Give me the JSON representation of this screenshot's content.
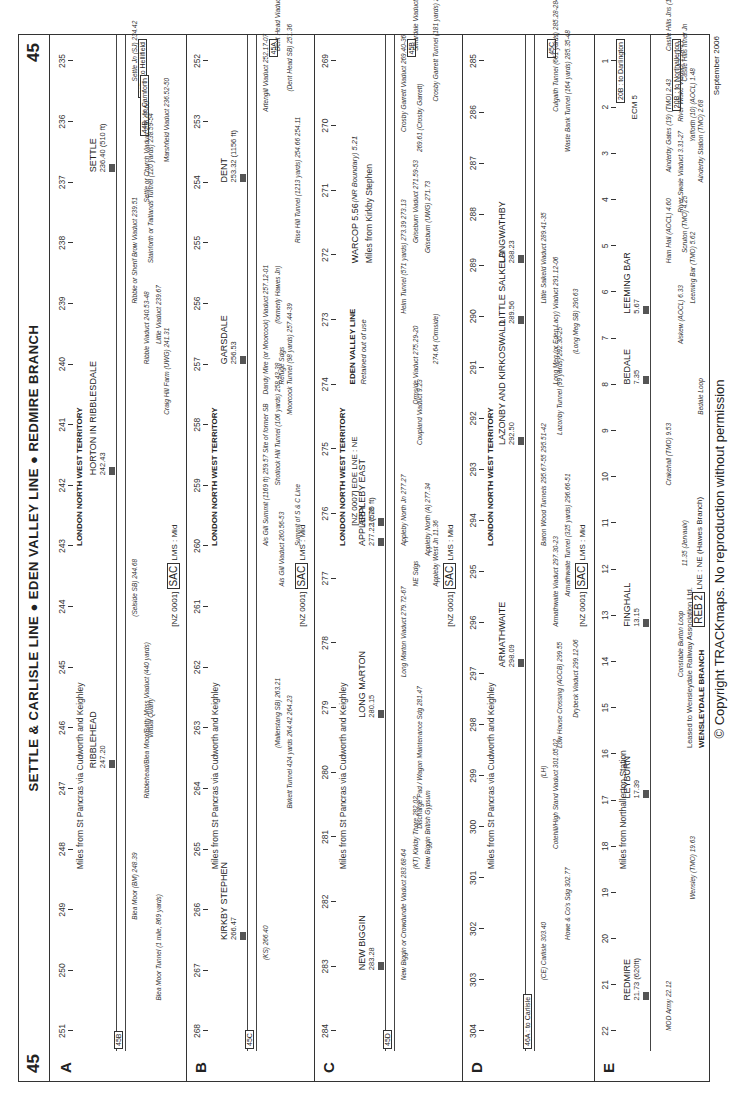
{
  "page": {
    "number": "45",
    "title": "SETTLE & CARLISLE LINE ● EDEN VALLEY LINE ● REDMIRE BRANCH",
    "copyright": "© Copyright TRACKmaps. No reproduction without permission",
    "date": "September 2006"
  },
  "strips": [
    {
      "letter": "A",
      "territory": "LONDON NORTH WEST TERRITORY",
      "miles_note": "Miles from St Pancras via Cudworth and Keighley",
      "code": {
        "prefix": "[NZ 0001]",
        "elr": "SAC",
        "suffix": "LMS : Mid"
      },
      "left_connector": "45B",
      "right_connector": "44B : to Hellifield",
      "branch_connector": "44B : to Carnforth",
      "mileposts": [
        "251",
        "250",
        "249",
        "248",
        "247",
        "246",
        "245",
        "244",
        "243",
        "242",
        "241",
        "240",
        "239",
        "238",
        "237",
        "236",
        "235"
      ],
      "stations": [
        {
          "name": "RIBBLEHEAD",
          "mileage": "247.20",
          "x": 0.28
        },
        {
          "name": "HORTON IN RIBBLESDALE",
          "mileage": "242.43",
          "x": 0.57
        },
        {
          "name": "SETTLE",
          "mileage": "236.40 (510 ft)",
          "x": 0.87
        }
      ],
      "features": [
        {
          "text": "Blea Moor (BM) 248.39",
          "x": 0.13
        },
        {
          "text": "Blea Moor Tunnel (1 mile, 869 yards)",
          "x": 0.05
        },
        {
          "text": "Ribblehead/Blea Moor/Batty Moss Viaduct (440 yards)",
          "x": 0.25
        },
        {
          "text": "Virtual Quarry",
          "x": 0.31
        },
        {
          "text": "(Selside SB) 244.68",
          "x": 0.43
        },
        {
          "text": "Craig Hill Farm (UWG) 241.31",
          "x": 0.63
        },
        {
          "text": "Ribble Viaduct 240.53-48",
          "x": 0.68
        },
        {
          "text": "Little Viaduct 239.67",
          "x": 0.7
        },
        {
          "text": "Ribble or Sherif Brow Viaduct 239.51",
          "x": 0.74
        },
        {
          "text": "Stainforth or Taitlands Tunnel (120 yards) 238.59-54",
          "x": 0.78
        },
        {
          "text": "Settle or Church Viaduct 236.67-60",
          "x": 0.84
        },
        {
          "text": "Marshfield Viaduct 236.52-50",
          "x": 0.88
        },
        {
          "text": "Settle Jn (SJ) 234.42",
          "x": 0.96
        }
      ]
    },
    {
      "letter": "B",
      "territory": "LONDON NORTH WEST TERRITORY",
      "miles_note": "Miles from St Pancras via Cudworth and Keighley",
      "code": {
        "prefix": "[NZ 0001]",
        "elr": "SAC",
        "suffix": "LMS : Mid"
      },
      "left_connector": "45C",
      "right_connector": "45A",
      "mileposts": [
        "268",
        "267",
        "266",
        "265",
        "264",
        "263",
        "262",
        "261",
        "260",
        "259",
        "258",
        "257",
        "256",
        "255",
        "254",
        "253",
        "252"
      ],
      "stations": [
        {
          "name": "KIRKBY STEPHEN",
          "mileage": "266.47",
          "x": 0.11
        },
        {
          "name": "GARSDALE",
          "mileage": "256.53",
          "x": 0.68
        },
        {
          "name": "DENT",
          "mileage": "253.32 (1156 ft)",
          "x": 0.86
        }
      ],
      "features": [
        {
          "text": "(KS) 266.40",
          "x": 0.09
        },
        {
          "text": "Birkett Tunnel 424 yards 264.42 264.23",
          "x": 0.24
        },
        {
          "text": "(Mallerstang SB) 263.21",
          "x": 0.3
        },
        {
          "text": "Ais Gill Viaduct 260.56-53",
          "x": 0.46
        },
        {
          "text": "Ais Gill Summit (1169 ft) 259.57 Site of former SB",
          "x": 0.5
        },
        {
          "text": "Summit of S & C Line",
          "x": 0.5
        },
        {
          "text": "Shotlock Hill Tunnel (106 yards) 258.43-38",
          "x": 0.56
        },
        {
          "text": "Moorcock Tunnel (98 yards) 257.44-39",
          "x": 0.63
        },
        {
          "text": "Dandy Mire (or Moorcock) Viaduct 257.12-01",
          "x": 0.65
        },
        {
          "text": "Refuge Sdgs",
          "x": 0.66
        },
        {
          "text": "(formerly Hawes Jn)",
          "x": 0.72
        },
        {
          "text": "Rise Hill Tunnel (1213 yards) 254.66 254.11",
          "x": 0.8
        },
        {
          "text": "Artengill Viaduct 252.17-07",
          "x": 0.93
        },
        {
          "text": "(Dent Head SB) 251.36",
          "x": 0.95
        },
        {
          "text": "Dent Head Viaduct 251.22-12",
          "x": 0.99
        }
      ]
    },
    {
      "letter": "C",
      "territory": "LONDON NORTH WEST TERRITORY",
      "miles_note": "Miles from St Pancras via Cudworth and Keighley",
      "code": {
        "prefix": "[NZ 0001]",
        "elr": "SAC",
        "suffix": "LMS : Mid"
      },
      "code2": {
        "prefix": "[NZ 0007]",
        "elr": "EDE",
        "suffix": "LNE : NE"
      },
      "eden_valley": {
        "title": "EDEN VALLEY LINE",
        "note": "Retained out of use",
        "miles_note": "Miles from Kirkby Stephen",
        "warcop": "WARCOP 5.56",
        "boundary": "(NR Boundary) 5.21",
        "railway": "(Stockton & Darlington Eden Valley Railway)"
      },
      "left_connector": "45D",
      "right_connector": "45B",
      "mileposts": [
        "284",
        "283",
        "282",
        "281",
        "280",
        "279",
        "278",
        "277",
        "276",
        "275",
        "274",
        "273",
        "272",
        "271",
        "270",
        "269"
      ],
      "stations": [
        {
          "name": "NEW BIGGIN",
          "mileage": "283.28",
          "x": 0.08
        },
        {
          "name": "LONG MARTON",
          "mileage": "280.15",
          "x": 0.33
        },
        {
          "name": "APPLEBY",
          "mileage": "277.22 (525 ft)",
          "x": 0.5
        },
        {
          "name": "APPLEBY EAST",
          "mileage": "10.78",
          "x": 0.52
        }
      ],
      "features": [
        {
          "text": "New Biggin or Crowdundle Viaduct 283.68-64",
          "x": 0.07
        },
        {
          "text": "New Biggin British Gypsum",
          "x": 0.18
        },
        {
          "text": "(KT) Kirkby Thore 282.02",
          "x": 0.18
        },
        {
          "text": "Discharge Pad / Wagon Maintenance Sdg 281.47",
          "x": 0.22
        },
        {
          "text": "Long Marton Viaduct 279.72-67",
          "x": 0.37
        },
        {
          "text": "Appleby West Jn 11.36",
          "x": 0.46
        },
        {
          "text": "NE Sdgs",
          "x": 0.46
        },
        {
          "text": "Appleby North (A) 277.34",
          "x": 0.49
        },
        {
          "text": "Appleby North Jn 277.27",
          "x": 0.5
        },
        {
          "text": "Coupland Viaduct 9.23",
          "x": 0.6
        },
        {
          "text": "Ormside Viaduct 275.29-20",
          "x": 0.64
        },
        {
          "text": "274.64 (Ormside)",
          "x": 0.68
        },
        {
          "text": "Helm Tunnel (571 yards) 273.39 273.13",
          "x": 0.73
        },
        {
          "text": "Griseburn (UWG) 271.73",
          "x": 0.79
        },
        {
          "text": "Griseburn Viaduct 271.59-53",
          "x": 0.8
        },
        {
          "text": "269.61 (Crosby Garrett)",
          "x": 0.89
        },
        {
          "text": "Crosby Garrett Viaduct 269.40-36",
          "x": 0.91
        },
        {
          "text": "Crosby Garrett Tunnel (181 yards) 269.08-00",
          "x": 0.94
        },
        {
          "text": "Smardale Viaduct 268.59-49",
          "x": 0.99
        }
      ]
    },
    {
      "letter": "D",
      "territory": "LONDON NORTH WEST TERRITORY",
      "miles_note": "Miles from St Pancras via Cudworth and Keighley",
      "code": {
        "prefix": "[NZ 0001]",
        "elr": "SAC",
        "suffix": "LMS : Mid"
      },
      "left_connector": "46A : to Carlisle",
      "right_connector": "45C",
      "mileposts": [
        "304",
        "303",
        "302",
        "301",
        "300",
        "299",
        "298",
        "297",
        "296",
        "295",
        "294",
        "293",
        "292",
        "291",
        "290",
        "289",
        "288",
        "287",
        "286",
        "285"
      ],
      "stations": [
        {
          "name": "ARMATHWAITE",
          "mileage": "298.09",
          "x": 0.38
        },
        {
          "name": "LAZONBY AND KIRKOSWALD",
          "mileage": "292.50",
          "x": 0.6
        },
        {
          "name": "LITTLE SALKELD",
          "mileage": "289.56",
          "x": 0.72
        },
        {
          "name": "LANGWATHBY",
          "mileage": "288.23",
          "x": 0.78
        }
      ],
      "features": [
        {
          "text": "(CE) Carlisle 303.40",
          "x": 0.07
        },
        {
          "text": "Howe & Co's Sdg 302.77",
          "x": 0.11
        },
        {
          "text": "Cotehill/High Stand Viaduct 301.05-02",
          "x": 0.2
        },
        {
          "text": "Low House Crossing (AOCB) 299.55",
          "x": 0.3
        },
        {
          "text": "(LH)",
          "x": 0.27
        },
        {
          "text": "Drybeck Viaduct 299.12-06",
          "x": 0.33
        },
        {
          "text": "Armathwaite Viaduct 297.30-23",
          "x": 0.42
        },
        {
          "text": "Armathwaite Tunnel (325 yards) 296.66-51",
          "x": 0.45
        },
        {
          "text": "Baron Wood Tunnels 295.67-55 295.51-42",
          "x": 0.5
        },
        {
          "text": "Lazonby Tunnel (99 yards) 292.30-25",
          "x": 0.61
        },
        {
          "text": "Long Meg (or Eden Lacy) Viaduct 291.12-06",
          "x": 0.66
        },
        {
          "text": "(Long Meg SB) 290.63",
          "x": 0.69
        },
        {
          "text": "Little Salkeld Viaduct 289.41-35",
          "x": 0.74
        },
        {
          "text": "Waste Bank Tunnel (164 yards) 285.35-48",
          "x": 0.89
        },
        {
          "text": "Culgaith Tunnel (661 yards) 285.28-284.79",
          "x": 0.93
        }
      ]
    },
    {
      "letter": "E",
      "territory": "",
      "miles_note": "Miles from Northallerton Station",
      "branch_title": "WENSLEYDALE BRANCH",
      "lease_note": "Leased to Wensleydale Railway Association Ltd.",
      "code": {
        "prefix": "",
        "elr": "REB",
        "num": "2",
        "suffix": "LNE : NE (Hawes Branch)"
      },
      "right_connector": "20B : to Northallerton",
      "top_connector": "20B : to Darlington",
      "ecm": "ECM 5",
      "mileposts": [
        "22",
        "21",
        "20",
        "19",
        "18",
        "17",
        "16",
        "15",
        "14",
        "13",
        "12",
        "11",
        "10",
        "9",
        "8",
        "7",
        "6",
        "5",
        "4",
        "3",
        "2",
        "1"
      ],
      "stations": [
        {
          "name": "REDMIRE",
          "mileage": "21.73 (620ft)",
          "x": 0.05
        },
        {
          "name": "LEYBURN",
          "mileage": "17.39",
          "x": 0.25
        },
        {
          "name": "FINGHALL",
          "mileage": "13.15",
          "x": 0.42
        },
        {
          "name": "BEDALE",
          "mileage": "7.35",
          "x": 0.66
        },
        {
          "name": "LEEMING BAR",
          "mileage": "5.67",
          "x": 0.73
        }
      ],
      "features": [
        {
          "text": "MOD Army 22.12",
          "x": 0.02
        },
        {
          "text": "Wensley (TMO) 19.63",
          "x": 0.15
        },
        {
          "text": "Constable Burton Loop",
          "x": 0.37
        },
        {
          "text": "11.35 (Jervaulx)",
          "x": 0.48
        },
        {
          "text": "Crakehall (TMO) 9.53",
          "x": 0.56
        },
        {
          "text": "Bedale Loop",
          "x": 0.63
        },
        {
          "text": "Aiskew (AOCL) 6.33",
          "x": 0.7
        },
        {
          "text": "Leeming Bar (TMO) 5.62",
          "x": 0.74
        },
        {
          "text": "Ham Hall (AOCL) 4.60",
          "x": 0.78
        },
        {
          "text": "Scruton (TMO) 4.25",
          "x": 0.79
        },
        {
          "text": "River Swale Viaduct 3.31-27",
          "x": 0.83
        },
        {
          "text": "Ainderby Station (TMO) 2.68",
          "x": 0.86
        },
        {
          "text": "Ainderby Gates (19) (TMO) 2.43",
          "x": 0.87
        },
        {
          "text": "Yafforth (10) (AOCL) 1.48",
          "x": 0.9
        },
        {
          "text": "River Wiske Viaduct 1.24-21",
          "x": 0.92
        },
        {
          "text": "Castle Hills Inner Jn",
          "x": 0.96
        },
        {
          "text": "Castle Hills Jns (145 ft)",
          "x": 0.99
        }
      ]
    }
  ]
}
